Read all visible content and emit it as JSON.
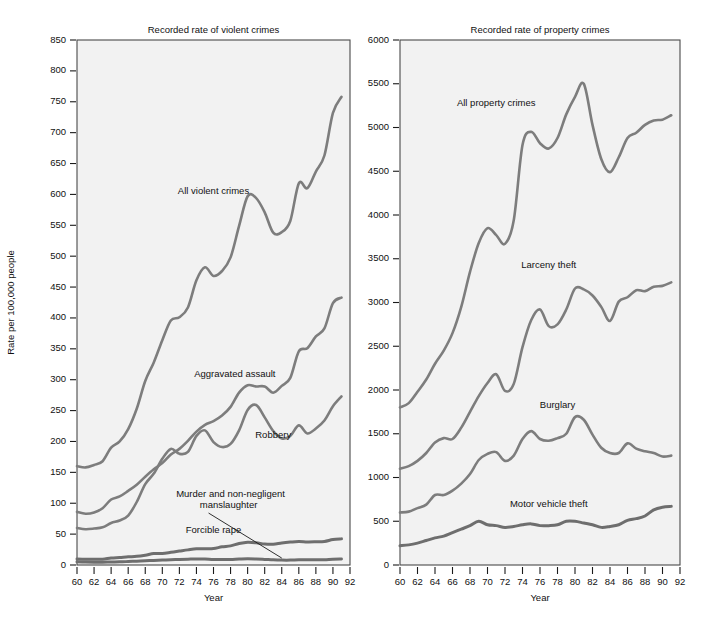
{
  "figure": {
    "background": "#ffffff",
    "plot_background": "#f2f2f2",
    "line_color": "#7d7d7d",
    "frame_color": "#4a4a4a"
  },
  "chart_data": [
    {
      "type": "line",
      "id": "violent",
      "title": "Recorded rate of violent crimes",
      "xlabel": "Year",
      "ylabel": "Rate per 100,000 people",
      "xlim": [
        60,
        92
      ],
      "ylim": [
        0,
        850
      ],
      "yticks": [
        0,
        50,
        100,
        150,
        200,
        250,
        300,
        350,
        400,
        450,
        500,
        550,
        600,
        650,
        700,
        750,
        800,
        850
      ],
      "xticks": [
        60,
        62,
        64,
        66,
        68,
        70,
        72,
        74,
        76,
        78,
        80,
        82,
        84,
        86,
        88,
        90,
        92
      ],
      "grid": false,
      "legend": "inline-annotations",
      "x": [
        60,
        61,
        62,
        63,
        64,
        65,
        66,
        67,
        68,
        69,
        70,
        71,
        72,
        73,
        74,
        75,
        76,
        77,
        78,
        79,
        80,
        81,
        82,
        83,
        84,
        85,
        86,
        87,
        88,
        89,
        90,
        91
      ],
      "series": [
        {
          "name": "All violent crimes",
          "label_x": 76,
          "label_y": 600,
          "values": [
            160,
            158,
            162,
            168,
            190,
            200,
            220,
            253,
            298,
            328,
            364,
            396,
            401,
            417,
            461,
            482,
            468,
            476,
            498,
            549,
            597,
            594,
            571,
            538,
            539,
            557,
            618,
            610,
            637,
            663,
            732,
            758
          ]
        },
        {
          "name": "Aggravated assault",
          "label_x": 78.5,
          "label_y": 305,
          "values": [
            86,
            83,
            85,
            92,
            106,
            111,
            120,
            130,
            143,
            155,
            165,
            179,
            188,
            201,
            216,
            227,
            233,
            242,
            256,
            279,
            291,
            289,
            289,
            279,
            290,
            303,
            346,
            351,
            370,
            383,
            424,
            433
          ]
        },
        {
          "name": "Robbery",
          "label_x": 83,
          "label_y": 205,
          "values": [
            60,
            58,
            59,
            61,
            68,
            72,
            80,
            102,
            131,
            148,
            172,
            188,
            180,
            183,
            209,
            218,
            199,
            191,
            196,
            218,
            251,
            259,
            239,
            217,
            205,
            209,
            226,
            213,
            221,
            234,
            257,
            273
          ]
        },
        {
          "name": "Forcible rape",
          "label_x": 76,
          "label_y": 52,
          "values": [
            9.6,
            9.4,
            9.4,
            9.4,
            11.2,
            12.1,
            13.2,
            14.0,
            15.9,
            18.5,
            18.7,
            20.5,
            22.5,
            24.5,
            26.2,
            26.3,
            26.6,
            29.4,
            31.0,
            34.7,
            36.8,
            36.0,
            34.0,
            33.7,
            35.7,
            37.1,
            38.1,
            37.4,
            37.6,
            38.1,
            41.2,
            42.3
          ]
        },
        {
          "name": "Murder and non-negligent manslaughter",
          "label_x": 78,
          "label_y": 110,
          "leader_to_x": 84,
          "leader_to_y": 8,
          "values": [
            5.1,
            4.8,
            4.6,
            4.6,
            4.9,
            5.1,
            5.6,
            6.2,
            6.9,
            7.3,
            7.9,
            8.6,
            9.0,
            9.4,
            9.8,
            9.6,
            8.8,
            8.8,
            9.0,
            9.7,
            10.2,
            9.8,
            9.1,
            8.3,
            7.9,
            7.9,
            8.6,
            8.3,
            8.4,
            8.7,
            9.4,
            9.8
          ]
        }
      ]
    },
    {
      "type": "line",
      "id": "property",
      "title": "Recorded rate of property crimes",
      "xlabel": "Year",
      "ylabel": "",
      "xlim": [
        60,
        92
      ],
      "ylim": [
        0,
        6000
      ],
      "yticks": [
        0,
        500,
        1000,
        1500,
        2000,
        2500,
        3000,
        3500,
        4000,
        4500,
        5000,
        5500,
        6000
      ],
      "xticks": [
        60,
        62,
        64,
        66,
        68,
        70,
        72,
        74,
        76,
        78,
        80,
        82,
        84,
        86,
        88,
        90,
        92
      ],
      "grid": false,
      "legend": "inline-annotations",
      "x": [
        60,
        61,
        62,
        63,
        64,
        65,
        66,
        67,
        68,
        69,
        70,
        71,
        72,
        73,
        74,
        75,
        76,
        77,
        78,
        79,
        80,
        81,
        82,
        83,
        84,
        85,
        86,
        87,
        88,
        89,
        90,
        91
      ],
      "series": [
        {
          "name": "All property crimes",
          "label_x": 71,
          "label_y": 5250,
          "values": [
            1800,
            1850,
            1980,
            2120,
            2300,
            2450,
            2650,
            2950,
            3350,
            3680,
            3850,
            3770,
            3670,
            3940,
            4800,
            4950,
            4820,
            4760,
            4880,
            5150,
            5350,
            5500,
            5030,
            4640,
            4490,
            4660,
            4880,
            4940,
            5030,
            5080,
            5090,
            5140
          ]
        },
        {
          "name": "Larceny theft",
          "label_x": 77,
          "label_y": 3400,
          "values": [
            1100,
            1130,
            1190,
            1280,
            1400,
            1450,
            1440,
            1570,
            1750,
            1930,
            2080,
            2180,
            1990,
            2070,
            2490,
            2800,
            2920,
            2730,
            2750,
            2920,
            3160,
            3150,
            3080,
            2950,
            2790,
            3010,
            3060,
            3140,
            3130,
            3180,
            3190,
            3230
          ]
        },
        {
          "name": "Burglary",
          "label_x": 78,
          "label_y": 1790,
          "values": [
            600,
            610,
            650,
            690,
            800,
            800,
            850,
            930,
            1040,
            1200,
            1270,
            1290,
            1190,
            1250,
            1440,
            1530,
            1440,
            1420,
            1450,
            1500,
            1690,
            1660,
            1490,
            1340,
            1280,
            1280,
            1390,
            1330,
            1300,
            1280,
            1240,
            1250
          ]
        },
        {
          "name": "Motor vehicle theft",
          "label_x": 77,
          "label_y": 660,
          "values": [
            220,
            230,
            250,
            280,
            310,
            330,
            370,
            410,
            450,
            500,
            460,
            450,
            430,
            440,
            460,
            470,
            450,
            450,
            460,
            500,
            500,
            480,
            460,
            430,
            440,
            460,
            510,
            530,
            560,
            630,
            660,
            670
          ]
        }
      ]
    }
  ]
}
